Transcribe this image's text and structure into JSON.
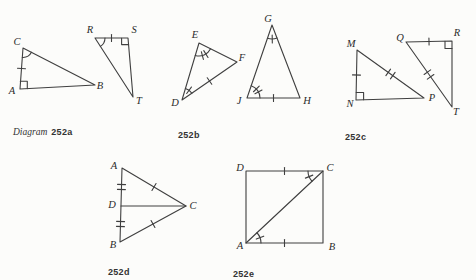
{
  "page": {
    "background": "#fcfcfa",
    "ink_color": "#3f3f3f",
    "label_color": "#2b2b2b"
  },
  "diagrams": {
    "a": {
      "caption_word": "Diagram",
      "caption_number": "252a",
      "labels": {
        "C": "C",
        "A": "A",
        "B": "B",
        "R": "R",
        "S": "S",
        "T": "T"
      },
      "marks": {
        "right_angles_at": [
          "A",
          "S"
        ],
        "angle_arcs_at": [
          "C",
          "R"
        ],
        "single_side_ticks_on": [
          "CA",
          "RS"
        ]
      }
    },
    "b": {
      "caption_number": "252b",
      "labels": {
        "E": "E",
        "F": "F",
        "D": "D",
        "G": "G",
        "J": "J",
        "H": "H"
      },
      "marks": {
        "angle_arcs_single_tick_at": [
          "D",
          "G"
        ],
        "angle_arcs_double_tick_at": [
          "E",
          "J"
        ],
        "single_side_ticks_on": [
          "DF",
          "JH"
        ]
      }
    },
    "c": {
      "caption_number": "252c",
      "labels": {
        "M": "M",
        "N": "N",
        "P": "P",
        "Q": "Q",
        "R": "R",
        "T": "T"
      },
      "marks": {
        "right_angles_at": [
          "N",
          "R"
        ],
        "single_side_ticks_on": [
          "MN",
          "QR"
        ],
        "double_side_ticks_on": [
          "MP",
          "QT"
        ]
      }
    },
    "d": {
      "caption_number": "252d",
      "labels": {
        "A": "A",
        "D": "D",
        "B": "B",
        "C": "C"
      },
      "marks": {
        "double_side_ticks_on": [
          "AD",
          "DB"
        ],
        "single_side_ticks_on": [
          "AC",
          "BC"
        ],
        "cevian": "DC"
      }
    },
    "e": {
      "caption_number": "252e",
      "labels": {
        "D": "D",
        "C": "C",
        "A": "A",
        "B": "B"
      },
      "marks": {
        "single_side_ticks_on": [
          "DC",
          "AB"
        ],
        "diagonal": "AC",
        "angle_arcs_single_tick_at": [
          "C (angle DCA)",
          "A (angle CAB)"
        ]
      }
    }
  }
}
